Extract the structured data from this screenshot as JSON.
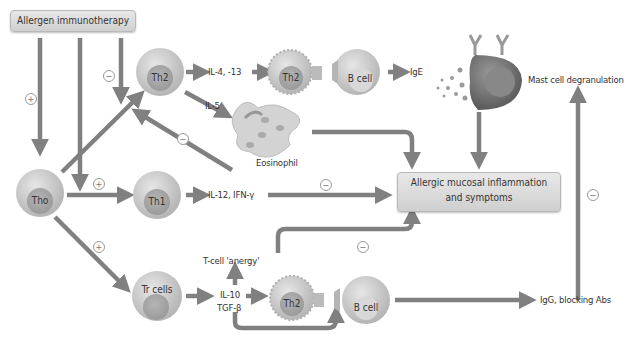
{
  "title_box": "Allergen immunotherapy",
  "outcome_box": {
    "line1": "Allergic mucosal inflammation",
    "line2": "and symptoms"
  },
  "cells": {
    "tho": "Tho",
    "th2_top": "Th2",
    "th1": "Th1",
    "tr": "Tr cells",
    "th2_mid": "Th2",
    "bcell_top": "B cell",
    "th2_bottom": "Th2",
    "bcell_bottom": "B cell",
    "eosinophil": "Eosinophil",
    "mast_cell": "Mast cell degranulation"
  },
  "labels": {
    "il4_13": "IL-4, -13",
    "il5": "IL-5",
    "ige": "IgE",
    "il12_ifn": "IL-12, IFN-γ",
    "anergy": "T-cell 'anergy'",
    "il10": "IL-10",
    "tgfb": "TGF-β",
    "igg": "IgG, blocking Abs"
  },
  "signs": {
    "plus": "+",
    "minus": "−"
  }
}
